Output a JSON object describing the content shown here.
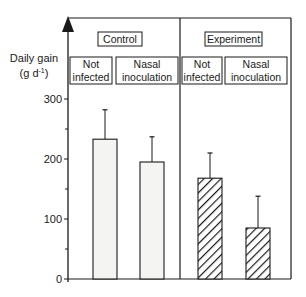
{
  "chart_data": {
    "type": "bar",
    "title": "",
    "xlabel": "",
    "ylabel": "Daily gain",
    "ylabel_unit": "(g d-1)",
    "ylabel_unit_base": "(g d",
    "ylabel_unit_sup": "-1",
    "ylabel_unit_close": ")",
    "ylim": [
      0,
      300
    ],
    "yticks": [
      0,
      100,
      200,
      300
    ],
    "ytick_labels": [
      "0",
      "100",
      "200",
      "300"
    ],
    "grid": false,
    "groups": [
      {
        "name": "Control",
        "categories": [
          "Not infected",
          "Nasal inoculation"
        ]
      },
      {
        "name": "Experiment",
        "categories": [
          "Not infected",
          "Nasal inoculation"
        ]
      }
    ],
    "categories": [
      "Control / Not infected",
      "Control / Nasal inoculation",
      "Experiment / Not infected",
      "Experiment / Nasal inoculation"
    ],
    "values": [
      233,
      195,
      168,
      85
    ],
    "error_upper": [
      282,
      237,
      210,
      138
    ],
    "fill": [
      "plain",
      "plain",
      "hatched",
      "hatched"
    ]
  },
  "labels": {
    "control": "Control",
    "experiment": "Experiment",
    "not": "Not",
    "infected": "infected",
    "nasal": "Nasal",
    "inoculation": "inoculation"
  },
  "colors": {
    "line": "#1a1a1a",
    "bar_fill": "#f4f4f2",
    "background": "#ffffff"
  }
}
